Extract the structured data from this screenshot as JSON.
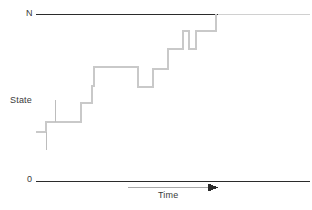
{
  "figure": {
    "kind": "step-plot",
    "title": "",
    "background_color": "#ffffff"
  },
  "labels": {
    "top_axis": "N",
    "bottom_axis": "0",
    "y_axis": "State",
    "x_axis": "Time"
  },
  "colors": {
    "axis_line": "#2b2b2b",
    "axis_line_tail": "#d0d0d0",
    "step_line": "#c9c9c9",
    "tick_mark": "#bdbdbd",
    "arrow": "#2b2b2b",
    "arrow_shaft": "#a8a8a8",
    "text": "#3a3a3a"
  },
  "chart_data": {
    "type": "line",
    "title": "",
    "xlabel": "Time",
    "ylabel": "State",
    "grid": false,
    "legend": null,
    "ylim": [
      0,
      1
    ],
    "ytick_labels": [
      "0",
      "N"
    ],
    "xlim": [
      0,
      1
    ],
    "annotations": [
      {
        "text": "N",
        "position": "top-left-axis"
      },
      {
        "text": "0",
        "position": "bottom-left-axis"
      },
      {
        "text": "State",
        "position": "left-middle"
      },
      {
        "text": "Time",
        "position": "bottom-center-under-arrow"
      }
    ],
    "series": [
      {
        "name": "state",
        "step": "post",
        "points_px": [
          [
            36,
            132
          ],
          [
            46,
            132
          ],
          [
            46,
            122
          ],
          [
            55,
            122
          ],
          [
            55,
            122
          ],
          [
            81,
            122
          ],
          [
            81,
            103
          ],
          [
            92,
            103
          ],
          [
            92,
            86
          ],
          [
            94,
            86
          ],
          [
            94,
            67
          ],
          [
            138,
            67
          ],
          [
            138,
            87
          ],
          [
            153,
            87
          ],
          [
            153,
            69
          ],
          [
            168,
            69
          ],
          [
            168,
            49
          ],
          [
            183,
            49
          ],
          [
            183,
            31
          ],
          [
            189,
            31
          ],
          [
            189,
            49
          ],
          [
            196,
            49
          ],
          [
            196,
            31
          ],
          [
            216,
            31
          ],
          [
            216,
            14
          ]
        ]
      }
    ],
    "tick_marks_px": [
      {
        "x": 55,
        "y0": 100,
        "y1": 122
      },
      {
        "x": 46,
        "y0": 132,
        "y1": 150
      },
      {
        "x": 36,
        "y": 132,
        "x1": 46
      }
    ],
    "axes_px": {
      "top_line": {
        "x0": 36,
        "x1": 218,
        "y": 14
      },
      "top_line_tail": {
        "x0": 218,
        "x1": 310,
        "y": 14
      },
      "bottom_line": {
        "x0": 36,
        "x1": 310,
        "y": 181
      },
      "time_arrow": {
        "x0": 128,
        "x1": 218,
        "y": 187
      }
    }
  }
}
